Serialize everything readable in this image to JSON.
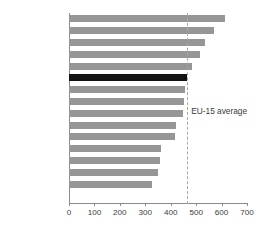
{
  "chart_data": {
    "type": "bar",
    "orientation": "horizontal",
    "title": "",
    "subtitle": "",
    "xlabel": "",
    "ylabel": "",
    "xlim": [
      0,
      700
    ],
    "xticks": [
      0,
      100,
      200,
      300,
      400,
      500,
      600,
      700
    ],
    "xtick_labels": [
      "0",
      "100",
      "200",
      "300",
      "400",
      "500",
      "600",
      "700"
    ],
    "grid": false,
    "legend": null,
    "categories": [
      "Luxembourg",
      "Italy",
      "Germany",
      "Austria",
      "France",
      "United Kingdom",
      "Belgium",
      "Sweden",
      "Spain",
      "Netherlands",
      "Finland",
      "Portugal",
      "Ireland",
      "Denmark",
      "Greece"
    ],
    "values": [
      615,
      570,
      535,
      515,
      485,
      465,
      455,
      453,
      450,
      420,
      415,
      362,
      358,
      350,
      325
    ],
    "highlight_category": "United Kingdom",
    "bar_color": "#969696",
    "highlight_color": "#141414",
    "annotations": [
      {
        "name": "eu-15-average",
        "label": "EU-15 average",
        "value": 465,
        "style": "dashed-vertical-line",
        "color": "#a8a8a8"
      }
    ]
  }
}
